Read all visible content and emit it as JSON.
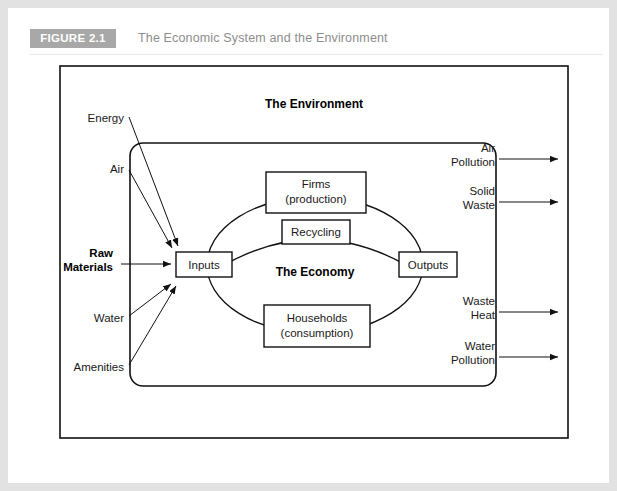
{
  "figure": {
    "badge_label": "FIGURE 2.1",
    "title": "The Economic System and the Environment",
    "badge_color": "#a8a8a8",
    "title_color": "#8d8d8d",
    "frame_color": "#e2e2e2"
  },
  "diagram": {
    "environment_label": "The Environment",
    "environment_fill": "#d4d4d4",
    "economy_label": "The Economy",
    "economy_fill": "#ffffff",
    "nodes": {
      "inputs": "Inputs",
      "outputs": "Outputs",
      "recycling": "Recycling",
      "firms_line1": "Firms",
      "firms_line2": "(production)",
      "households_line1": "Households",
      "households_line2": "(consumption)"
    },
    "inputs_arrows": [
      {
        "line1": "Energy",
        "line2": "",
        "bold": false
      },
      {
        "line1": "Air",
        "line2": "",
        "bold": false
      },
      {
        "line1": "Raw",
        "line2": "Materials",
        "bold": true
      },
      {
        "line1": "Water",
        "line2": "",
        "bold": false
      },
      {
        "line1": "Amenities",
        "line2": "",
        "bold": false
      }
    ],
    "outputs_arrows": [
      {
        "line1": "Air",
        "line2": "Pollution"
      },
      {
        "line1": "Solid",
        "line2": "Waste"
      },
      {
        "line1": "Waste",
        "line2": "Heat"
      },
      {
        "line1": "Water",
        "line2": "Pollution"
      }
    ]
  }
}
